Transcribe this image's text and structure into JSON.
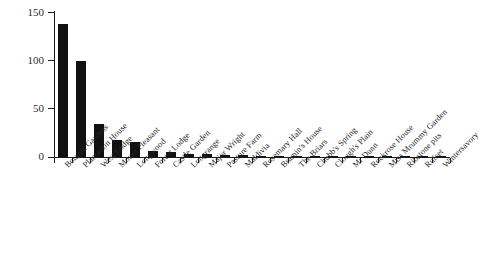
{
  "chart_data": {
    "type": "bar",
    "title": "",
    "subtitle": "",
    "xlabel": "",
    "ylabel": "",
    "ylim": [
      0,
      150
    ],
    "yticks": [
      0,
      50,
      100,
      150
    ],
    "ytick_labels": [
      "0",
      "50",
      "100",
      "150"
    ],
    "grid": false,
    "legend": "none",
    "bar_color": "#111111",
    "axis_color": "#1a1a1a",
    "categories": [
      "Botanic Gardens",
      "Plantation House",
      "West Lodge",
      "Mount Pleasant",
      "Longwood",
      "Forest Lodge",
      "Castle Garden",
      "Longrange",
      "Major Wright",
      "Pasture Farm",
      "Maldivia",
      "Rosemary Hall",
      "Bramin's House",
      "The Briars",
      "Chubb's Spring",
      "Clough's Plain",
      "Mr Dunn",
      "Rockrose House",
      "Miss Mrummy Garden",
      "Ribstone pits",
      "Rufset",
      "Wintersavory"
    ],
    "values": [
      138,
      99,
      34,
      18,
      16,
      6,
      5,
      3,
      3,
      2,
      2,
      1.5,
      1,
      1,
      1,
      1,
      1,
      1,
      1,
      1,
      1,
      1
    ]
  }
}
